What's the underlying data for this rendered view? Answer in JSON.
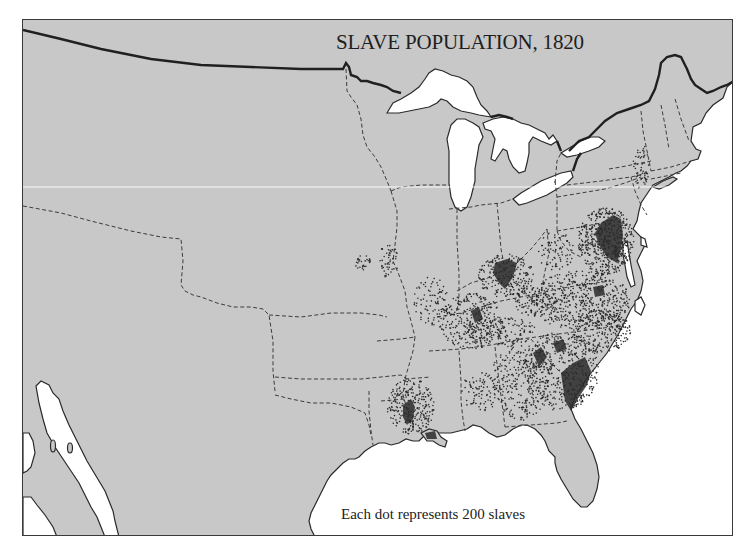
{
  "map": {
    "title": "SLAVE POPULATION, 1820",
    "legend": "Each dot represents 200 slaves",
    "colors": {
      "land": "#c8c8c8",
      "water": "#ffffff",
      "borders": "#2a2a2a",
      "dots": "#2b2b2b"
    },
    "regions_of_high_density": [
      "Virginia Tidewater / Chesapeake",
      "Central Kentucky (Bluegrass)",
      "South Carolina Lowcountry",
      "Central Tennessee",
      "Louisiana (lower Mississippi)",
      "Georgia / Alabama piedmont"
    ]
  }
}
